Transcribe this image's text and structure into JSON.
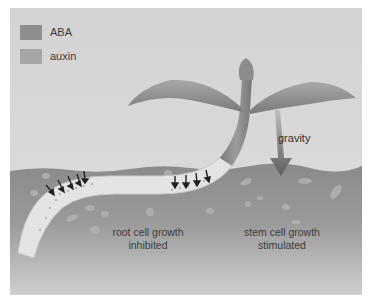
{
  "figure": {
    "legend": [
      {
        "label": "ABA",
        "color": "#8e8e8e"
      },
      {
        "label": "auxin",
        "color": "#a6a6a6"
      }
    ],
    "labels": {
      "gravity": "gravity",
      "root_line1": "root cell growth",
      "root_line2": "inhibited",
      "stem_line1": "stem cell growth",
      "stem_line2": "stimulated"
    },
    "colors": {
      "sky": "#d7d7d7",
      "soil": "#8f8f8f",
      "soil_light": "#c9c9c9",
      "plant": "#8a8a8a",
      "root": "#e6e6e6",
      "arrow": "#2a2a2a"
    }
  }
}
